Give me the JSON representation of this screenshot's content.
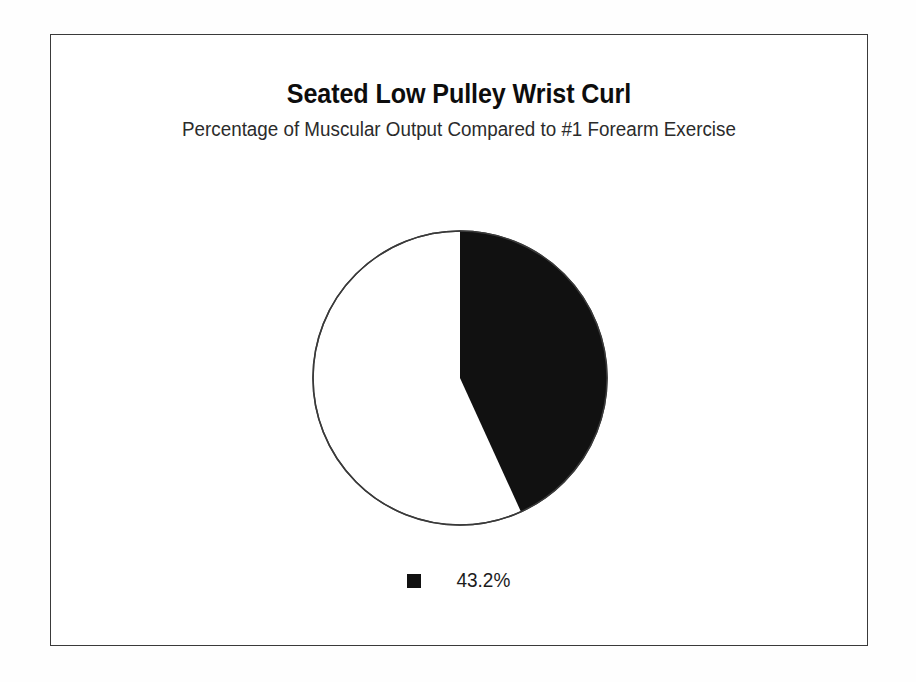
{
  "chart_data": {
    "type": "pie",
    "title": "Seated Low Pulley Wrist Curl",
    "subtitle": "Percentage of Muscular Output Compared to #1 Forearm Exercise",
    "xlabel": "",
    "ylabel": "",
    "grid": false,
    "legend_position": "bottom",
    "start_angle_deg": 0,
    "direction": "clockwise",
    "categories": [
      "43.2%",
      "remainder"
    ],
    "values": [
      43.2,
      56.8
    ],
    "slices": [
      {
        "label": "43.2%",
        "value": 43.2,
        "color": "#111111",
        "sweep_deg": 155.5,
        "in_legend": true
      },
      {
        "label": "",
        "value": 56.8,
        "color": "#ffffff",
        "sweep_deg": 204.5,
        "in_legend": false
      }
    ],
    "legend": [
      {
        "label": "43.2%",
        "color": "#111111"
      }
    ],
    "outline_color": "#3a3a3a"
  },
  "frame": {
    "border_color": "#3a3a3a",
    "background": "#ffffff"
  },
  "geometry": {
    "center_x": 149,
    "center_y": 149,
    "radius": 147
  }
}
